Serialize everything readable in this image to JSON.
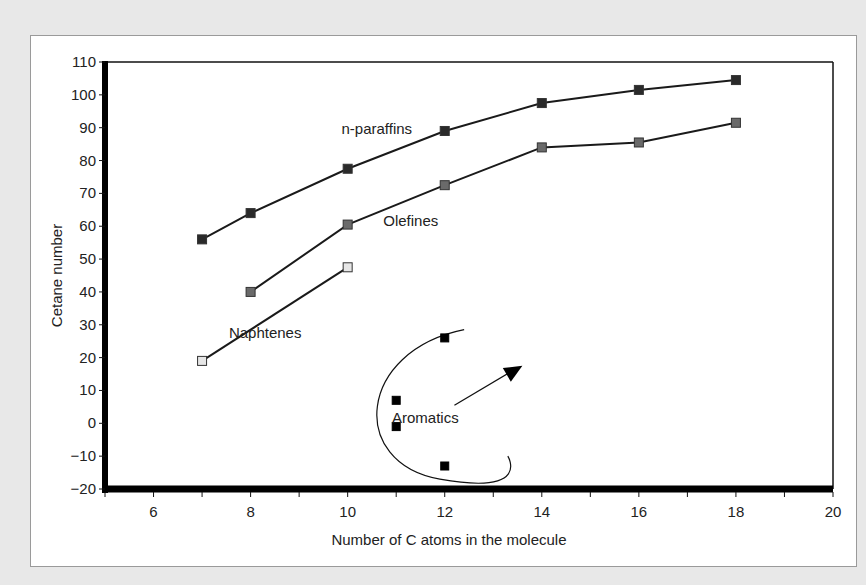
{
  "chart_data": {
    "type": "line",
    "title": "",
    "xlabel": "Number of C atoms in the molecule",
    "ylabel": "Cetane number",
    "xlim": [
      5,
      20
    ],
    "ylim": [
      -20,
      110
    ],
    "xticks": [
      6,
      8,
      10,
      12,
      14,
      16,
      18,
      20
    ],
    "yticks": [
      110,
      100,
      90,
      80,
      70,
      60,
      50,
      40,
      30,
      20,
      10,
      0,
      -10,
      -20
    ],
    "ytick_labels": [
      "110",
      "100",
      "90",
      "80",
      "70",
      "60",
      "50",
      "40",
      "30",
      "20",
      "10",
      "0",
      "−10",
      "−20"
    ],
    "grid": false,
    "legend": "inline annotations",
    "series": [
      {
        "name": "n-paraffins",
        "marker_color": "#2a2a2a",
        "connected": true,
        "x": [
          7,
          8,
          10,
          12,
          14,
          16,
          18
        ],
        "y": [
          56,
          64,
          77.5,
          89,
          97.5,
          101.5,
          104.5
        ]
      },
      {
        "name": "Olefines",
        "marker_color": "#6a6a6a",
        "connected": true,
        "x": [
          8,
          10,
          12,
          14,
          16,
          18
        ],
        "y": [
          40,
          60.5,
          72.5,
          84,
          85.5,
          91.5
        ]
      },
      {
        "name": "Naphtenes",
        "marker_color": "#e6e6e6",
        "connected": true,
        "x": [
          7,
          10
        ],
        "y": [
          19,
          47.5
        ]
      },
      {
        "name": "Aromatics",
        "marker_color": "#000000",
        "connected": false,
        "x": [
          11,
          11,
          12,
          12
        ],
        "y": [
          7,
          -1,
          26,
          -13
        ]
      }
    ],
    "annotations": [
      {
        "text": "n-paraffins",
        "x": 10.6,
        "y": 88
      },
      {
        "text": "Olefines",
        "x": 11.3,
        "y": 60
      },
      {
        "text": "Naphtenes",
        "x": 8.3,
        "y": 26
      },
      {
        "text": "Aromatics",
        "x": 11.6,
        "y": 0
      },
      {
        "text": "arrow",
        "from": [
          12.2,
          5.5
        ],
        "to": [
          13.6,
          17.5
        ]
      }
    ]
  }
}
